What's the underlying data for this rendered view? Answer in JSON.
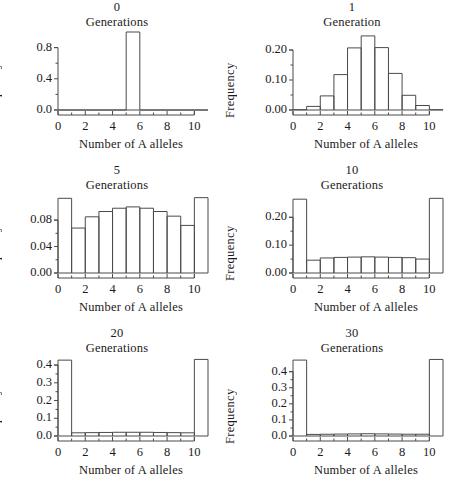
{
  "figure": {
    "panel_count": 6,
    "shared_xlabel": "Number of A alleles",
    "shared_ylabel": "Frequency"
  },
  "panels": [
    {
      "id": "panel-0-generations",
      "gen_num": "0",
      "gen_word": "Generations",
      "xlabel": "Number of A alleles",
      "ylabel": "Frequency",
      "ytick_labels": [
        "0.0",
        "0.4",
        "0.8"
      ],
      "xtick_labels": [
        "0",
        "2",
        "4",
        "6",
        "8",
        "10"
      ]
    },
    {
      "id": "panel-1-generation",
      "gen_num": "1",
      "gen_word": "Generation",
      "xlabel": "Number of A alleles",
      "ylabel": "Frequency",
      "ytick_labels": [
        "0.00",
        "0.10",
        "0.20"
      ],
      "xtick_labels": [
        "0",
        "2",
        "4",
        "6",
        "8",
        "10"
      ]
    },
    {
      "id": "panel-5-generations",
      "gen_num": "5",
      "gen_word": "Generations",
      "xlabel": "Number of A alleles",
      "ylabel": "Frequency",
      "ytick_labels": [
        "0.00",
        "0.04",
        "0.08"
      ],
      "xtick_labels": [
        "0",
        "2",
        "4",
        "6",
        "8",
        "10"
      ]
    },
    {
      "id": "panel-10-generations",
      "gen_num": "10",
      "gen_word": "Generations",
      "xlabel": "Number of A alleles",
      "ylabel": "Frequency",
      "ytick_labels": [
        "0.00",
        "0.10",
        "0.20"
      ],
      "xtick_labels": [
        "0",
        "2",
        "4",
        "6",
        "8",
        "10"
      ]
    },
    {
      "id": "panel-20-generations",
      "gen_num": "20",
      "gen_word": "Generations",
      "xlabel": "Number of A alleles",
      "ylabel": "Frequency",
      "ytick_labels": [
        "0.0",
        "0.1",
        "0.2",
        "0.3",
        "0.4"
      ],
      "xtick_labels": [
        "0",
        "2",
        "4",
        "6",
        "8",
        "10"
      ]
    },
    {
      "id": "panel-30-generations",
      "gen_num": "30",
      "gen_word": "Generations",
      "xlabel": "Number of A alleles",
      "ylabel": "Frequency",
      "ytick_labels": [
        "0.0",
        "0.1",
        "0.2",
        "0.3",
        "0.4"
      ],
      "xtick_labels": [
        "0",
        "2",
        "4",
        "6",
        "8",
        "10"
      ]
    }
  ],
  "chart_data": [
    {
      "type": "bar",
      "title": "0 Generations",
      "xlabel": "Number of A alleles",
      "ylabel": "Frequency",
      "categories": [
        "0-1",
        "1-2",
        "2-3",
        "3-4",
        "4-5",
        "5-6",
        "6-7",
        "7-8",
        "8-9",
        "9-10",
        "10-11"
      ],
      "bin_left_edges": [
        0,
        1,
        2,
        3,
        4,
        5,
        6,
        7,
        8,
        9,
        10
      ],
      "values": [
        0,
        0,
        0,
        0,
        0,
        1.0,
        0,
        0,
        0,
        0,
        0
      ],
      "xlim": [
        0,
        11
      ],
      "ylim": [
        0,
        1.0
      ],
      "yticks": [
        0.0,
        0.4,
        0.8
      ],
      "xticks": [
        0,
        2,
        4,
        6,
        8,
        10
      ],
      "grid": false,
      "legend": "none"
    },
    {
      "type": "bar",
      "title": "1 Generation",
      "xlabel": "Number of A alleles",
      "ylabel": "Frequency",
      "categories": [
        "0-1",
        "1-2",
        "2-3",
        "3-4",
        "4-5",
        "5-6",
        "6-7",
        "7-8",
        "8-9",
        "9-10",
        "10-11"
      ],
      "bin_left_edges": [
        0,
        1,
        2,
        3,
        4,
        5,
        6,
        7,
        8,
        9,
        10
      ],
      "values": [
        0.001,
        0.012,
        0.047,
        0.118,
        0.207,
        0.247,
        0.208,
        0.122,
        0.049,
        0.015,
        0.001
      ],
      "xlim": [
        0,
        11
      ],
      "ylim": [
        0,
        0.26
      ],
      "yticks": [
        0.0,
        0.1,
        0.2
      ],
      "xticks": [
        0,
        2,
        4,
        6,
        8,
        10
      ],
      "grid": false,
      "legend": "none"
    },
    {
      "type": "bar",
      "title": "5 Generations",
      "xlabel": "Number of A alleles",
      "ylabel": "Frequency",
      "categories": [
        "0-1",
        "1-2",
        "2-3",
        "3-4",
        "4-5",
        "5-6",
        "6-7",
        "7-8",
        "8-9",
        "9-10",
        "10-11"
      ],
      "bin_left_edges": [
        0,
        1,
        2,
        3,
        4,
        5,
        6,
        7,
        8,
        9,
        10
      ],
      "values": [
        0.113,
        0.068,
        0.085,
        0.093,
        0.098,
        0.1,
        0.098,
        0.093,
        0.086,
        0.072,
        0.114
      ],
      "xlim": [
        0,
        11
      ],
      "ylim": [
        0,
        0.118
      ],
      "yticks": [
        0.0,
        0.04,
        0.08
      ],
      "xticks": [
        0,
        2,
        4,
        6,
        8,
        10
      ],
      "grid": false,
      "legend": "none"
    },
    {
      "type": "bar",
      "title": "10 Generations",
      "xlabel": "Number of A alleles",
      "ylabel": "Frequency",
      "categories": [
        "0-1",
        "1-2",
        "2-3",
        "3-4",
        "4-5",
        "5-6",
        "6-7",
        "7-8",
        "8-9",
        "9-10",
        "10-11"
      ],
      "bin_left_edges": [
        0,
        1,
        2,
        3,
        4,
        5,
        6,
        7,
        8,
        9,
        10
      ],
      "values": [
        0.265,
        0.046,
        0.054,
        0.056,
        0.057,
        0.058,
        0.057,
        0.056,
        0.055,
        0.05,
        0.268
      ],
      "xlim": [
        0,
        11
      ],
      "ylim": [
        0,
        0.28
      ],
      "yticks": [
        0.0,
        0.1,
        0.2
      ],
      "xticks": [
        0,
        2,
        4,
        6,
        8,
        10
      ],
      "grid": false,
      "legend": "none"
    },
    {
      "type": "bar",
      "title": "20 Generations",
      "xlabel": "Number of A alleles",
      "ylabel": "Frequency",
      "categories": [
        "0-1",
        "1-2",
        "2-3",
        "3-4",
        "4-5",
        "5-6",
        "6-7",
        "7-8",
        "8-9",
        "9-10",
        "10-11"
      ],
      "bin_left_edges": [
        0,
        1,
        2,
        3,
        4,
        5,
        6,
        7,
        8,
        9,
        10
      ],
      "values": [
        0.428,
        0.018,
        0.019,
        0.02,
        0.021,
        0.021,
        0.021,
        0.02,
        0.019,
        0.018,
        0.432
      ],
      "xlim": [
        0,
        11
      ],
      "ylim": [
        0,
        0.44
      ],
      "yticks": [
        0.0,
        0.1,
        0.2,
        0.3,
        0.4
      ],
      "xticks": [
        0,
        2,
        4,
        6,
        8,
        10
      ],
      "grid": false,
      "legend": "none"
    },
    {
      "type": "bar",
      "title": "30 Generations",
      "xlabel": "Number of A alleles",
      "ylabel": "Frequency",
      "categories": [
        "0-1",
        "1-2",
        "2-3",
        "3-4",
        "4-5",
        "5-6",
        "6-7",
        "7-8",
        "8-9",
        "9-10",
        "10-11"
      ],
      "bin_left_edges": [
        0,
        1,
        2,
        3,
        4,
        5,
        6,
        7,
        8,
        9,
        10
      ],
      "values": [
        0.472,
        0.01,
        0.011,
        0.012,
        0.013,
        0.014,
        0.013,
        0.012,
        0.011,
        0.011,
        0.476
      ],
      "xlim": [
        0,
        11
      ],
      "ylim": [
        0,
        0.485
      ],
      "yticks": [
        0.0,
        0.1,
        0.2,
        0.3,
        0.4
      ],
      "xticks": [
        0,
        2,
        4,
        6,
        8,
        10
      ],
      "grid": false,
      "legend": "none"
    }
  ]
}
